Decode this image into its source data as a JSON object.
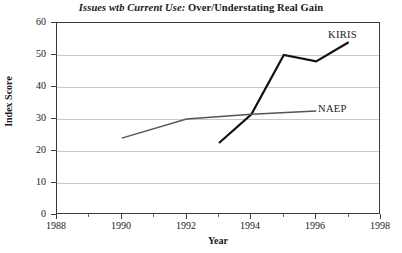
{
  "chart_data": {
    "type": "line",
    "title": "Issues wtb Current Use: Over/Understating Real Gain",
    "title_italic_part": "Issues wtb Current Use:",
    "title_roman_part": "Over/Understating Real Gain",
    "xlabel": "Year",
    "ylabel": "Index Score",
    "xlim": [
      1988,
      1998
    ],
    "ylim": [
      0,
      60
    ],
    "grid": true,
    "legend_position": "inline-right",
    "x_ticks_major": [
      1988,
      1990,
      1992,
      1994,
      1996,
      1998
    ],
    "x_ticks_minor": [
      1989,
      1991,
      1993,
      1995,
      1997
    ],
    "x_tick_labels": [
      "1988",
      "1990",
      "1992",
      "1994",
      "1996",
      "1998"
    ],
    "y_ticks": [
      0,
      10,
      20,
      30,
      40,
      50,
      60
    ],
    "y_tick_labels": [
      "0",
      "10",
      "20",
      "30",
      "40",
      "50",
      "60"
    ],
    "series": [
      {
        "name": "KIRIS",
        "color": "#111111",
        "width": 2.2,
        "x": [
          1993,
          1994,
          1995,
          1996,
          1997
        ],
        "values": [
          22.5,
          31.5,
          50.0,
          48.0,
          54.0
        ]
      },
      {
        "name": "NAEP",
        "color": "#555555",
        "width": 1.4,
        "x": [
          1990,
          1992,
          1994,
          1996
        ],
        "values": [
          24.0,
          30.0,
          31.5,
          32.5
        ]
      }
    ],
    "annotations": [
      {
        "text": "KIRIS",
        "series": "KIRIS"
      },
      {
        "text": "NAEP",
        "series": "NAEP"
      }
    ]
  }
}
